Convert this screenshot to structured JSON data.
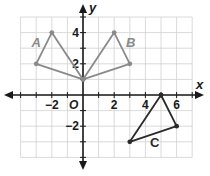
{
  "graph": {
    "axis_labels": {
      "x": "x",
      "y": "y"
    },
    "origin_label": "O",
    "x_ticks": [
      {
        "value": -2,
        "label": "−2"
      },
      {
        "value": 2,
        "label": "2"
      },
      {
        "value": 4,
        "label": "4"
      },
      {
        "value": 6,
        "label": "6"
      }
    ],
    "y_ticks": [
      {
        "value": 4,
        "label": "4"
      },
      {
        "value": 2,
        "label": "2"
      },
      {
        "value": -2,
        "label": "−2"
      }
    ],
    "grid": {
      "x_min": -4,
      "x_max": 7,
      "y_min": -4,
      "y_max": 5
    },
    "colors": {
      "grid": "#d0d0d0",
      "axis": "#1a1a1a",
      "figure_ab": "#8a8a8a",
      "figure_c": "#2a2a2a"
    },
    "figures": [
      {
        "name": "A",
        "vertices": [
          [
            -3,
            2
          ],
          [
            -2,
            4
          ],
          [
            0,
            1
          ]
        ],
        "label_pos": [
          -3.3,
          3.05
        ],
        "color_key": "figure_ab"
      },
      {
        "name": "B",
        "vertices": [
          [
            0,
            1
          ],
          [
            2,
            4
          ],
          [
            3,
            2
          ]
        ],
        "label_pos": [
          2.75,
          3.05
        ],
        "color_key": "figure_ab"
      },
      {
        "name": "C",
        "vertices": [
          [
            3,
            -3
          ],
          [
            5,
            0
          ],
          [
            6,
            -2
          ]
        ],
        "label_pos": [
          4.3,
          -3.35
        ],
        "color_key": "figure_c"
      }
    ]
  }
}
